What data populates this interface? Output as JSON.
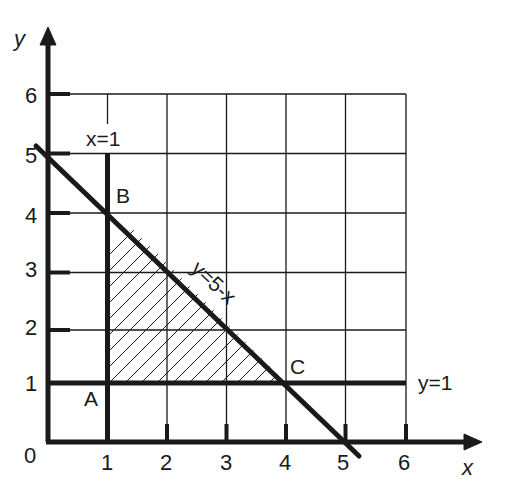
{
  "diagram": {
    "type": "linear-programming-region",
    "axes": {
      "x_label": "x",
      "y_label": "y",
      "origin_label": "0",
      "x_ticks": [
        "1",
        "2",
        "3",
        "4",
        "5",
        "6"
      ],
      "y_ticks": [
        "1",
        "2",
        "3",
        "4",
        "5",
        "6"
      ]
    },
    "lines": {
      "vertical": "x=1",
      "horizontal": "y=1",
      "diagonal": "y=5-x"
    },
    "points": {
      "A": "A",
      "B": "B",
      "C": "C"
    },
    "vertices": [
      {
        "name": "A",
        "x": 1,
        "y": 1
      },
      {
        "name": "B",
        "x": 1,
        "y": 4
      },
      {
        "name": "C",
        "x": 4,
        "y": 1
      }
    ],
    "shaded_region": "triangle ABC (hatched)",
    "grid": {
      "x_range": [
        0,
        6
      ],
      "y_range": [
        0,
        6
      ],
      "step": 1
    },
    "colors": {
      "ink": "#1a1a1a",
      "background": "#ffffff"
    }
  }
}
